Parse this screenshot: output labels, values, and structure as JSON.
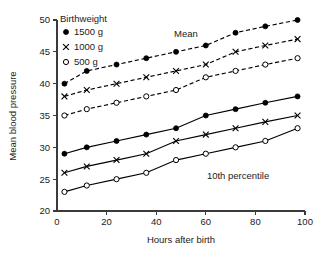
{
  "chart_data": {
    "type": "line",
    "title": "",
    "xlabel": "Hours after birth",
    "ylabel": "Mean blood pressure",
    "xlim": [
      0,
      100
    ],
    "ylim": [
      20,
      50
    ],
    "xticks": [
      0,
      20,
      40,
      60,
      80,
      100
    ],
    "yticks": [
      20,
      25,
      30,
      35,
      40,
      45,
      50
    ],
    "grid": false,
    "legend_position": "top-left-inside",
    "legend_title": "Birthweight",
    "x": [
      3,
      12,
      24,
      36,
      48,
      60,
      72,
      84,
      97
    ],
    "annotations": [
      {
        "text": "Mean",
        "x": 52,
        "y": 47.3
      },
      {
        "text": "10th percentile",
        "x": 73,
        "y": 25.1
      }
    ],
    "series": [
      {
        "name": "1500 g",
        "group": "Mean",
        "marker": "filled-circle",
        "linestyle": "dashed",
        "values": [
          40,
          42,
          43,
          44,
          45,
          46,
          48,
          49,
          50
        ]
      },
      {
        "name": "1000 g",
        "group": "Mean",
        "marker": "cross",
        "linestyle": "dashed",
        "values": [
          38,
          39,
          40,
          41,
          42,
          43,
          45,
          46,
          47
        ]
      },
      {
        "name": "500 g",
        "group": "Mean",
        "marker": "open-circle",
        "linestyle": "dashed",
        "values": [
          35,
          36,
          37,
          38,
          39,
          41,
          42,
          43,
          44
        ]
      },
      {
        "name": "1500 g",
        "group": "10th percentile",
        "marker": "filled-circle",
        "linestyle": "solid",
        "values": [
          29,
          30,
          31,
          32,
          33,
          35,
          36,
          37,
          38
        ]
      },
      {
        "name": "1000 g",
        "group": "10th percentile",
        "marker": "cross",
        "linestyle": "solid",
        "values": [
          26,
          27,
          28,
          29,
          31,
          32,
          33,
          34,
          35
        ]
      },
      {
        "name": "500 g",
        "group": "10th percentile",
        "marker": "open-circle",
        "linestyle": "solid",
        "values": [
          23,
          24,
          25,
          26,
          28,
          29,
          30,
          31,
          33
        ]
      }
    ],
    "legend_entries": [
      {
        "marker": "filled-circle",
        "label": "1500 g"
      },
      {
        "marker": "cross",
        "label": "1000 g"
      },
      {
        "marker": "open-circle",
        "label": "500 g"
      }
    ],
    "colors": {
      "line": "#000000",
      "axis": "#3b3b3b",
      "text": "#1a1a1a",
      "background": "#ffffff"
    }
  }
}
